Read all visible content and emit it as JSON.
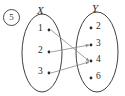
{
  "figure": {
    "item_number": "5",
    "left_set": {
      "label": "X",
      "elements": [
        {
          "value": "1",
          "x": 38,
          "y": 23,
          "dot_x": 49,
          "dot_y": 30
        },
        {
          "value": "2",
          "x": 38,
          "y": 45,
          "dot_x": 49,
          "dot_y": 52
        },
        {
          "value": "3",
          "x": 38,
          "y": 66,
          "dot_x": 49,
          "dot_y": 73
        }
      ]
    },
    "right_set": {
      "label": "Y",
      "elements": [
        {
          "value": "2",
          "x": 96,
          "y": 21,
          "dot_x": 91,
          "dot_y": 28
        },
        {
          "value": "3",
          "x": 96,
          "y": 38,
          "dot_x": 91,
          "dot_y": 45
        },
        {
          "value": "4",
          "x": 96,
          "y": 54,
          "dot_x": 91,
          "dot_y": 61
        },
        {
          "value": "6",
          "x": 96,
          "y": 71,
          "dot_x": 91,
          "dot_y": 78
        }
      ]
    },
    "arrows": [
      {
        "from": "1",
        "to": "4",
        "x1": 51,
        "y1": 30,
        "x2": 89,
        "y2": 61
      },
      {
        "from": "2",
        "to": "3",
        "x1": 51,
        "y1": 52,
        "x2": 89,
        "y2": 45
      },
      {
        "from": "3",
        "to": "4",
        "x1": 51,
        "y1": 73,
        "x2": 89,
        "y2": 62
      }
    ],
    "colors": {
      "outline": "#2b2b2b",
      "arrow": "#8a8a8a",
      "text": "#2b2b2b",
      "background": "#ffffff"
    },
    "ovals": {
      "left": {
        "cx": 42,
        "cy": 53,
        "rx": 20,
        "ry": 39
      },
      "right": {
        "cx": 97,
        "cy": 52,
        "rx": 21,
        "ry": 40
      }
    }
  }
}
